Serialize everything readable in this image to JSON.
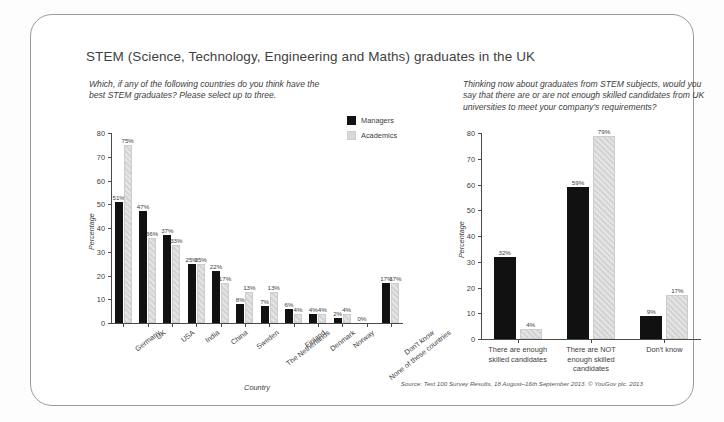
{
  "card": {
    "title": "STEM (Science, Technology, Engineering and Maths) graduates in the UK",
    "source": "Source: Text 100 Survey Results, 18 August–16th September 2013. © YouGov plc. 2013"
  },
  "legend": {
    "managers_label": "Managers",
    "academics_label": "Academics",
    "managers_color": "#111111",
    "academics_color": "#dcdcdc"
  },
  "left": {
    "question": "Which, if any of the following countries do you think have the best STEM graduates? Please select up to three."
  },
  "right": {
    "question": "Thinking now about graduates from STEM subjects, would you say that there are or are not enough skilled candidates from UK universities to meet your company's requirements?"
  },
  "chart_data": [
    {
      "id": "countries",
      "type": "bar",
      "title": "",
      "xlabel": "Country",
      "ylabel": "Percentage",
      "ylim": [
        0,
        80
      ],
      "yticks": [
        0,
        10,
        20,
        30,
        40,
        50,
        60,
        70,
        80
      ],
      "grid": false,
      "legend_position": "top-right",
      "categories": [
        "Germany",
        "UK",
        "USA",
        "India",
        "China",
        "Sweden",
        "The Netherlands",
        "Finland",
        "Denmark",
        "Norway",
        "None of these countries",
        "Don't know"
      ],
      "series": [
        {
          "name": "Managers",
          "color": "#111111",
          "values": [
            51,
            47,
            37,
            25,
            22,
            8,
            7,
            6,
            4,
            2,
            0,
            17
          ],
          "labels": [
            "51%",
            "47%",
            "37%",
            "25%",
            "22%",
            "8%",
            "7%",
            "6%",
            "4%",
            "2%",
            "0%",
            "17%"
          ]
        },
        {
          "name": "Academics",
          "color": "#dcdcdc",
          "values": [
            75,
            36,
            33,
            25,
            17,
            13,
            13,
            4,
            4,
            4,
            0,
            17
          ],
          "labels": [
            "75%",
            "36%",
            "33%",
            "25%",
            "17%",
            "13%",
            "13%",
            "4%",
            "4%",
            "4%",
            "",
            "17%"
          ]
        }
      ]
    },
    {
      "id": "skilled-candidates",
      "type": "bar",
      "title": "",
      "xlabel": "",
      "ylabel": "Percentage",
      "ylim": [
        0,
        80
      ],
      "yticks": [
        0,
        10,
        20,
        30,
        40,
        50,
        60,
        70,
        80
      ],
      "grid": false,
      "legend_position": "none",
      "categories": [
        "There are enough skilled candidates",
        "There are NOT enough skilled candidates",
        "Don't know"
      ],
      "series": [
        {
          "name": "Managers",
          "color": "#111111",
          "values": [
            32,
            59,
            9
          ],
          "labels": [
            "32%",
            "59%",
            "9%"
          ]
        },
        {
          "name": "Academics",
          "color": "#dcdcdc",
          "values": [
            4,
            79,
            17
          ],
          "labels": [
            "4%",
            "79%",
            "17%"
          ]
        }
      ]
    }
  ]
}
